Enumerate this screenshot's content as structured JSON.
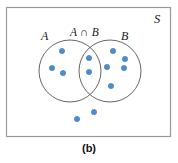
{
  "figure": {
    "caption": "(b)",
    "type": "venn-diagram",
    "universe_label": "S",
    "set_a_label": "A",
    "set_b_label": "B",
    "intersection_label": "A ∩ B"
  },
  "colors": {
    "dot_fill": "#4a90d9",
    "dot_stroke": "#2e6da4",
    "circle_stroke": "#555555",
    "frame_stroke": "#999999",
    "background": "#ffffff",
    "text": "#1a1a1a"
  },
  "geometry": {
    "frame": {
      "x": 6,
      "y": 7,
      "width": 164,
      "height": 129
    },
    "circle_a": {
      "cx": 70,
      "cy": 71,
      "r": 31
    },
    "circle_b": {
      "cx": 110,
      "cy": 71,
      "r": 31
    }
  },
  "chart_data": {
    "type": "scatter",
    "title": "(b)",
    "regions": [
      {
        "name": "A only",
        "count": 3
      },
      {
        "name": "A ∩ B",
        "count": 2
      },
      {
        "name": "B only",
        "count": 5
      },
      {
        "name": "outside A ∪ B (in S)",
        "count": 2
      }
    ],
    "total_points": 12,
    "points": [
      {
        "x": 62,
        "y": 51,
        "region": "A only"
      },
      {
        "x": 52,
        "y": 68,
        "region": "A only"
      },
      {
        "x": 63,
        "y": 73,
        "region": "A only"
      },
      {
        "x": 89,
        "y": 58,
        "region": "A ∩ B"
      },
      {
        "x": 89,
        "y": 72,
        "region": "A ∩ B"
      },
      {
        "x": 113,
        "y": 51,
        "region": "B only"
      },
      {
        "x": 125,
        "y": 59,
        "region": "B only"
      },
      {
        "x": 124,
        "y": 68,
        "region": "B only"
      },
      {
        "x": 107,
        "y": 67,
        "region": "B only"
      },
      {
        "x": 111,
        "y": 86,
        "region": "B only"
      },
      {
        "x": 94,
        "y": 112,
        "region": "outside A ∪ B (in S)"
      },
      {
        "x": 77,
        "y": 119,
        "region": "outside A ∪ B (in S)"
      }
    ],
    "dot_radius": 2.6,
    "xlabel": "",
    "ylabel": "",
    "legend": []
  }
}
